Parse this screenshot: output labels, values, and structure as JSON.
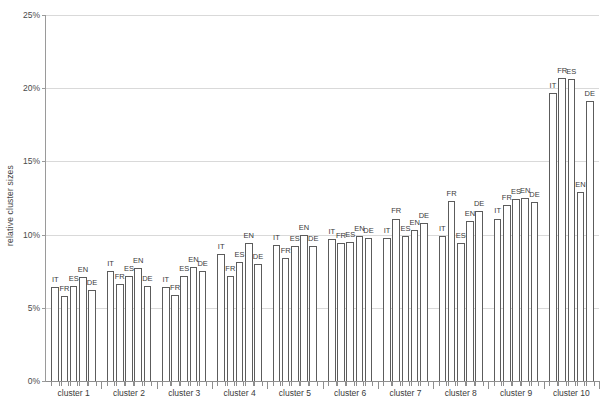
{
  "chart_data": {
    "type": "bar",
    "title": "",
    "xlabel": "",
    "ylabel": "relative cluster sizes",
    "ylim": [
      0,
      25
    ],
    "ytick_labels": [
      "0%",
      "5%",
      "10%",
      "15%",
      "20%",
      "25%"
    ],
    "ytick_values": [
      0,
      5,
      10,
      15,
      20,
      25
    ],
    "grid": true,
    "legend": "none",
    "value_unit": "%",
    "bar_labels_shown": true,
    "categories": [
      "cluster 1",
      "cluster 2",
      "cluster 3",
      "cluster 4",
      "cluster 5",
      "cluster 6",
      "cluster 7",
      "cluster 8",
      "cluster 9",
      "cluster 10"
    ],
    "series": [
      {
        "name": "IT",
        "values": [
          6.4,
          7.5,
          6.4,
          8.7,
          9.3,
          9.7,
          9.8,
          9.9,
          11.1,
          19.7
        ]
      },
      {
        "name": "FR",
        "values": [
          5.8,
          6.6,
          5.9,
          7.2,
          8.4,
          9.4,
          11.1,
          12.3,
          12.0,
          20.7
        ]
      },
      {
        "name": "ES",
        "values": [
          6.5,
          7.2,
          7.2,
          8.1,
          9.2,
          9.5,
          9.9,
          9.4,
          12.4,
          20.6
        ]
      },
      {
        "name": "EN",
        "values": [
          7.1,
          7.7,
          7.8,
          9.4,
          10.0,
          9.9,
          10.3,
          10.9,
          12.5,
          12.9
        ]
      },
      {
        "name": "DE",
        "values": [
          6.2,
          6.5,
          7.5,
          8.0,
          9.2,
          9.8,
          10.8,
          11.6,
          12.2,
          19.1
        ]
      }
    ]
  },
  "axis": {
    "y_title": "relative cluster sizes"
  }
}
